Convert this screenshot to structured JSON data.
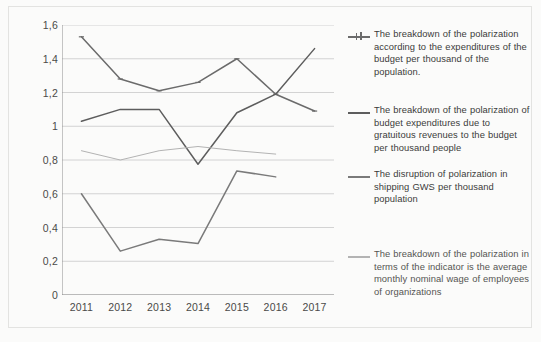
{
  "chart_data": {
    "type": "line",
    "title": "",
    "subtitle": "",
    "xlabel": "",
    "ylabel": "",
    "categories": [
      "2011",
      "2012",
      "2013",
      "2014",
      "2015",
      "2016",
      "2017"
    ],
    "x_tick_labels": [
      "2011",
      "2012",
      "2013",
      "2014",
      "2015",
      "2016",
      "2017"
    ],
    "y_tick_labels": [
      "1,6",
      "1,4",
      "1,2",
      "1",
      "0,8",
      "0,6",
      "0,4",
      "0,2",
      "0"
    ],
    "y_tick_values": [
      1.6,
      1.4,
      1.2,
      1.0,
      0.8,
      0.6,
      0.4,
      0.2,
      0
    ],
    "ylim": [
      0,
      1.6
    ],
    "grid": true,
    "grid_axis": "y",
    "legend_position": "right",
    "series": [
      {
        "name": "The breakdown of the polarization according to the expenditures of the budget per thousand of the population.",
        "color": "#6b6b6b",
        "marker": "cross",
        "x": [
          "2011",
          "2012",
          "2013",
          "2014",
          "2015",
          "2016",
          "2017"
        ],
        "values": [
          1.53,
          1.28,
          1.21,
          1.26,
          1.4,
          1.19,
          1.09
        ]
      },
      {
        "name": "The breakdown of the polarization of budget expenditures due to gratuitous revenues to the budget per thousand people",
        "color": "#5d5d5d",
        "marker": "none",
        "x": [
          "2011",
          "2012",
          "2013",
          "2014",
          "2015",
          "2016",
          "2017"
        ],
        "values": [
          1.03,
          1.1,
          1.1,
          0.775,
          1.08,
          1.19,
          1.46
        ]
      },
      {
        "name": "The disruption of polarization in shipping GWS per thousand population",
        "color": "#7a7a7a",
        "marker": "none",
        "x": [
          "2011",
          "2012",
          "2013",
          "2014",
          "2015",
          "2016"
        ],
        "values": [
          0.6,
          0.26,
          0.33,
          0.305,
          0.735,
          0.7
        ]
      },
      {
        "name": "The breakdown of the polarization in terms of the indicator is the average monthly nominal wage of employees of organizations",
        "color": "#b3b3b3",
        "marker": "none",
        "x": [
          "2011",
          "2012",
          "2013",
          "2014",
          "2015",
          "2016"
        ],
        "values": [
          0.855,
          0.8,
          0.855,
          0.88,
          0.855,
          0.835
        ]
      }
    ]
  },
  "legend": {
    "entries": [
      {
        "label": "The breakdown of the polarization according to the expenditures of the budget per thousand of the population.",
        "color": "#6b6b6b"
      },
      {
        "label": "The breakdown of the polarization of budget expenditures due to gratuitous revenues to the budget per thousand people",
        "color": "#5d5d5d"
      },
      {
        "label": "The disruption of polarization in shipping GWS per thousand population",
        "color": "#7a7a7a"
      },
      {
        "label": "The breakdown of the polarization in terms of the indicator is the average monthly nominal wage of employees of organizations",
        "color": "#b3b3b3"
      }
    ]
  },
  "colors": {
    "grid": "#c9c9c9",
    "axis": "#8d8d8d",
    "text": "#3c3c3a",
    "background": "#fbfbfa"
  }
}
